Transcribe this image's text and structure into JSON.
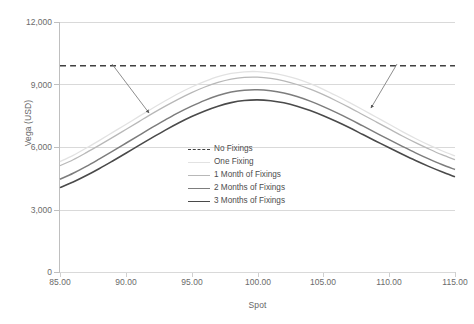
{
  "chart_data": {
    "type": "line",
    "title": "",
    "xlabel": "Spot",
    "ylabel": "Vega (USD)",
    "xlim": [
      85,
      115
    ],
    "ylim": [
      0,
      12000
    ],
    "xticks": [
      "85.00",
      "90.00",
      "95.00",
      "100.00",
      "105.00",
      "110.00",
      "115.00"
    ],
    "xtick_values": [
      85,
      90,
      95,
      100,
      105,
      110,
      115
    ],
    "yticks": [
      "0",
      "3,000",
      "6,000",
      "9,000",
      "12,000"
    ],
    "ytick_values": [
      0,
      3000,
      6000,
      9000,
      12000
    ],
    "grid": true,
    "legend_position": "center",
    "x": [
      85,
      86,
      87,
      88,
      89,
      90,
      91,
      92,
      93,
      94,
      95,
      96,
      97,
      98,
      99,
      100,
      101,
      102,
      103,
      104,
      105,
      106,
      107,
      108,
      109,
      110,
      111,
      112,
      113,
      114,
      115
    ],
    "series": [
      {
        "name": "No Fixings",
        "style": "dashed",
        "color": "#404040",
        "width": 1.7,
        "constant": 9900,
        "values": [
          9900,
          9900,
          9900,
          9900,
          9900,
          9900,
          9900,
          9900,
          9900,
          9900,
          9900,
          9900,
          9900,
          9900,
          9900,
          9900,
          9900,
          9900,
          9900,
          9900,
          9900,
          9900,
          9900,
          9900,
          9900,
          9900,
          9900,
          9900,
          9900,
          9900,
          9900
        ]
      },
      {
        "name": "One Fixing",
        "style": "solid",
        "color": "#e2e2e2",
        "width": 1.3,
        "values": [
          5300,
          5600,
          5950,
          6320,
          6700,
          7080,
          7470,
          7850,
          8220,
          8570,
          8880,
          9150,
          9380,
          9530,
          9610,
          9620,
          9560,
          9440,
          9270,
          9040,
          8770,
          8460,
          8130,
          7790,
          7440,
          7090,
          6740,
          6410,
          6100,
          5820,
          5570
        ]
      },
      {
        "name": "1 Month of Fixings",
        "style": "solid",
        "color": "#b8b8b8",
        "width": 1.3,
        "values": [
          5100,
          5390,
          5730,
          6090,
          6460,
          6840,
          7220,
          7600,
          7960,
          8300,
          8610,
          8880,
          9100,
          9260,
          9340,
          9350,
          9290,
          9170,
          9000,
          8780,
          8510,
          8210,
          7890,
          7550,
          7210,
          6870,
          6530,
          6210,
          5910,
          5630,
          5390
        ]
      },
      {
        "name": "2 Months of Fixings",
        "style": "solid",
        "color": "#7d7d7d",
        "width": 1.5,
        "values": [
          4450,
          4740,
          5070,
          5430,
          5800,
          6180,
          6560,
          6940,
          7300,
          7650,
          7960,
          8240,
          8470,
          8640,
          8730,
          8750,
          8700,
          8590,
          8420,
          8200,
          7940,
          7650,
          7340,
          7010,
          6680,
          6350,
          6030,
          5720,
          5430,
          5160,
          4920
        ]
      },
      {
        "name": "3 Months of Fixings",
        "style": "solid",
        "color": "#4a4a4a",
        "width": 1.6,
        "values": [
          4050,
          4320,
          4630,
          4970,
          5330,
          5700,
          6080,
          6450,
          6810,
          7150,
          7460,
          7730,
          7960,
          8130,
          8230,
          8260,
          8220,
          8120,
          7960,
          7750,
          7500,
          7220,
          6920,
          6600,
          6280,
          5960,
          5650,
          5350,
          5070,
          4810,
          4570
        ]
      }
    ],
    "annotations": [
      {
        "name": "left-arrow",
        "x1": 112,
        "y1": 64,
        "x2": 149,
        "y2": 113
      },
      {
        "name": "right-arrow",
        "x1": 397,
        "y1": 64,
        "x2": 371,
        "y2": 108
      }
    ],
    "colors": {
      "gridline": "#d9d9d9",
      "axis": "#bfbfbf",
      "text": "#6b6b6b",
      "annotation": "#808080"
    }
  }
}
